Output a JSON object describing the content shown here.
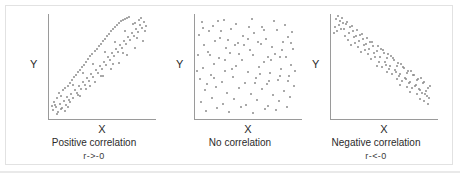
{
  "figure": {
    "title": "",
    "panel_count": 3,
    "colors": {
      "dot": "#8d8d8d",
      "axis": "#9a9a9a",
      "text": "#2b2b2b",
      "frame_border": "#e2e2e2",
      "background": "#ffffff"
    }
  },
  "panels": [
    {
      "id": "positive",
      "axis_y_label": "Y",
      "axis_x_label": "X",
      "caption": "Positive correlation",
      "caption_sub": "r->-0"
    },
    {
      "id": "none",
      "axis_y_label": "Y",
      "axis_x_label": "X",
      "caption": "No correlation",
      "caption_sub": ""
    },
    {
      "id": "negative",
      "axis_y_label": "Y",
      "axis_x_label": "X",
      "caption": "Negative correlation",
      "caption_sub": "r-<-0"
    }
  ],
  "chart_data": [
    {
      "type": "scatter",
      "title": "Positive correlation",
      "subtitle": "r->-0",
      "xlabel": "X",
      "ylabel": "Y",
      "xlim": [
        0,
        100
      ],
      "ylim": [
        0,
        100
      ],
      "grid": false,
      "legend": "none",
      "correlation_sign": "positive",
      "points": [
        [
          4,
          6
        ],
        [
          7,
          9
        ],
        [
          5,
          14
        ],
        [
          9,
          4
        ],
        [
          11,
          12
        ],
        [
          8,
          18
        ],
        [
          13,
          8
        ],
        [
          12,
          20
        ],
        [
          15,
          15
        ],
        [
          10,
          23
        ],
        [
          17,
          11
        ],
        [
          14,
          26
        ],
        [
          18,
          19
        ],
        [
          16,
          28
        ],
        [
          20,
          16
        ],
        [
          19,
          30
        ],
        [
          22,
          22
        ],
        [
          21,
          33
        ],
        [
          24,
          18
        ],
        [
          23,
          36
        ],
        [
          26,
          26
        ],
        [
          25,
          39
        ],
        [
          28,
          23
        ],
        [
          27,
          41
        ],
        [
          30,
          30
        ],
        [
          29,
          44
        ],
        [
          32,
          27
        ],
        [
          31,
          46
        ],
        [
          34,
          34
        ],
        [
          33,
          49
        ],
        [
          36,
          31
        ],
        [
          35,
          51
        ],
        [
          38,
          38
        ],
        [
          37,
          54
        ],
        [
          40,
          35
        ],
        [
          39,
          56
        ],
        [
          42,
          42
        ],
        [
          41,
          59
        ],
        [
          44,
          39
        ],
        [
          43,
          61
        ],
        [
          46,
          46
        ],
        [
          45,
          64
        ],
        [
          48,
          43
        ],
        [
          47,
          66
        ],
        [
          50,
          50
        ],
        [
          49,
          69
        ],
        [
          52,
          47
        ],
        [
          51,
          71
        ],
        [
          54,
          54
        ],
        [
          53,
          74
        ],
        [
          56,
          51
        ],
        [
          55,
          76
        ],
        [
          58,
          58
        ],
        [
          57,
          79
        ],
        [
          60,
          55
        ],
        [
          59,
          81
        ],
        [
          62,
          62
        ],
        [
          61,
          84
        ],
        [
          64,
          59
        ],
        [
          63,
          86
        ],
        [
          66,
          66
        ],
        [
          65,
          88
        ],
        [
          68,
          63
        ],
        [
          67,
          90
        ],
        [
          70,
          70
        ],
        [
          69,
          92
        ],
        [
          72,
          67
        ],
        [
          71,
          94
        ],
        [
          74,
          74
        ],
        [
          73,
          95
        ],
        [
          76,
          71
        ],
        [
          75,
          96
        ],
        [
          78,
          78
        ],
        [
          77,
          97
        ],
        [
          80,
          75
        ],
        [
          79,
          98
        ],
        [
          82,
          82
        ],
        [
          84,
          79
        ],
        [
          86,
          86
        ],
        [
          88,
          83
        ],
        [
          90,
          90
        ],
        [
          92,
          87
        ],
        [
          94,
          93
        ],
        [
          96,
          89
        ],
        [
          6,
          11
        ],
        [
          12,
          7
        ],
        [
          21,
          14
        ],
        [
          29,
          21
        ],
        [
          37,
          27
        ],
        [
          45,
          34
        ],
        [
          53,
          40
        ],
        [
          61,
          47
        ],
        [
          69,
          53
        ],
        [
          77,
          60
        ],
        [
          85,
          67
        ],
        [
          93,
          74
        ],
        [
          89,
          95
        ],
        [
          83,
          91
        ],
        [
          3,
          10
        ],
        [
          16,
          5
        ],
        [
          24,
          31
        ],
        [
          34,
          43
        ],
        [
          44,
          52
        ],
        [
          55,
          63
        ],
        [
          65,
          73
        ],
        [
          75,
          84
        ],
        [
          85,
          92
        ],
        [
          91,
          97
        ],
        [
          95,
          84
        ],
        [
          87,
          77
        ],
        [
          73,
          62
        ],
        [
          63,
          52
        ],
        [
          51,
          40
        ],
        [
          41,
          30
        ],
        [
          31,
          20
        ],
        [
          19,
          9
        ],
        [
          8,
          2
        ]
      ]
    },
    {
      "type": "scatter",
      "title": "No correlation",
      "subtitle": "",
      "xlabel": "X",
      "ylabel": "Y",
      "xlim": [
        0,
        100
      ],
      "ylim": [
        0,
        100
      ],
      "grid": false,
      "legend": "none",
      "correlation_sign": "none",
      "points": [
        [
          7,
          93
        ],
        [
          18,
          89
        ],
        [
          29,
          95
        ],
        [
          41,
          91
        ],
        [
          56,
          96
        ],
        [
          66,
          88
        ],
        [
          78,
          94
        ],
        [
          89,
          90
        ],
        [
          96,
          83
        ],
        [
          4,
          80
        ],
        [
          14,
          84
        ],
        [
          25,
          77
        ],
        [
          36,
          86
        ],
        [
          47,
          79
        ],
        [
          58,
          82
        ],
        [
          70,
          76
        ],
        [
          81,
          85
        ],
        [
          92,
          78
        ],
        [
          9,
          70
        ],
        [
          20,
          74
        ],
        [
          31,
          67
        ],
        [
          43,
          72
        ],
        [
          54,
          65
        ],
        [
          65,
          71
        ],
        [
          76,
          68
        ],
        [
          87,
          73
        ],
        [
          97,
          66
        ],
        [
          3,
          60
        ],
        [
          13,
          63
        ],
        [
          24,
          57
        ],
        [
          35,
          62
        ],
        [
          46,
          55
        ],
        [
          57,
          60
        ],
        [
          68,
          54
        ],
        [
          79,
          61
        ],
        [
          90,
          58
        ],
        [
          8,
          48
        ],
        [
          19,
          52
        ],
        [
          30,
          45
        ],
        [
          41,
          50
        ],
        [
          52,
          44
        ],
        [
          63,
          49
        ],
        [
          74,
          43
        ],
        [
          85,
          47
        ],
        [
          95,
          51
        ],
        [
          5,
          37
        ],
        [
          16,
          41
        ],
        [
          27,
          34
        ],
        [
          38,
          39
        ],
        [
          49,
          33
        ],
        [
          60,
          38
        ],
        [
          71,
          32
        ],
        [
          82,
          36
        ],
        [
          93,
          40
        ],
        [
          10,
          26
        ],
        [
          21,
          29
        ],
        [
          32,
          23
        ],
        [
          44,
          28
        ],
        [
          55,
          22
        ],
        [
          66,
          27
        ],
        [
          77,
          21
        ],
        [
          88,
          25
        ],
        [
          98,
          30
        ],
        [
          6,
          14
        ],
        [
          17,
          18
        ],
        [
          28,
          12
        ],
        [
          39,
          17
        ],
        [
          50,
          11
        ],
        [
          61,
          16
        ],
        [
          72,
          10
        ],
        [
          83,
          15
        ],
        [
          94,
          19
        ],
        [
          11,
          5
        ],
        [
          22,
          8
        ],
        [
          34,
          4
        ],
        [
          45,
          9
        ],
        [
          57,
          3
        ],
        [
          69,
          7
        ],
        [
          80,
          6
        ],
        [
          91,
          9
        ],
        [
          15,
          60
        ],
        [
          26,
          84
        ],
        [
          37,
          47
        ],
        [
          48,
          70
        ],
        [
          59,
          33
        ],
        [
          72,
          58
        ],
        [
          84,
          40
        ],
        [
          95,
          72
        ],
        [
          12,
          32
        ],
        [
          23,
          94
        ],
        [
          33,
          75
        ],
        [
          44,
          61
        ],
        [
          53,
          88
        ],
        [
          64,
          42
        ],
        [
          75,
          55
        ],
        [
          86,
          65
        ],
        [
          2,
          45
        ],
        [
          99,
          45
        ],
        [
          40,
          70
        ],
        [
          52,
          76
        ],
        [
          68,
          85
        ],
        [
          30,
          55
        ],
        [
          19,
          38
        ],
        [
          8,
          87
        ],
        [
          62,
          73
        ],
        [
          73,
          35
        ],
        [
          84,
          58
        ],
        [
          92,
          35
        ]
      ]
    },
    {
      "type": "scatter",
      "title": "Negative correlation",
      "subtitle": "r-<-0",
      "xlabel": "X",
      "ylabel": "Y",
      "xlim": [
        0,
        100
      ],
      "ylim": [
        0,
        100
      ],
      "grid": false,
      "legend": "none",
      "correlation_sign": "negative",
      "points": [
        [
          5,
          96
        ],
        [
          8,
          90
        ],
        [
          11,
          97
        ],
        [
          13,
          86
        ],
        [
          16,
          93
        ],
        [
          18,
          82
        ],
        [
          21,
          89
        ],
        [
          23,
          78
        ],
        [
          26,
          85
        ],
        [
          28,
          74
        ],
        [
          31,
          81
        ],
        [
          33,
          70
        ],
        [
          36,
          77
        ],
        [
          38,
          66
        ],
        [
          41,
          73
        ],
        [
          43,
          62
        ],
        [
          46,
          69
        ],
        [
          48,
          58
        ],
        [
          51,
          65
        ],
        [
          53,
          54
        ],
        [
          56,
          61
        ],
        [
          58,
          50
        ],
        [
          61,
          57
        ],
        [
          63,
          46
        ],
        [
          66,
          53
        ],
        [
          68,
          42
        ],
        [
          71,
          49
        ],
        [
          73,
          38
        ],
        [
          76,
          45
        ],
        [
          78,
          34
        ],
        [
          81,
          41
        ],
        [
          83,
          30
        ],
        [
          86,
          37
        ],
        [
          88,
          26
        ],
        [
          91,
          33
        ],
        [
          93,
          22
        ],
        [
          96,
          28
        ],
        [
          6,
          84
        ],
        [
          9,
          94
        ],
        [
          14,
          79
        ],
        [
          19,
          88
        ],
        [
          24,
          72
        ],
        [
          29,
          80
        ],
        [
          34,
          65
        ],
        [
          39,
          73
        ],
        [
          44,
          58
        ],
        [
          49,
          66
        ],
        [
          54,
          51
        ],
        [
          59,
          59
        ],
        [
          64,
          44
        ],
        [
          69,
          52
        ],
        [
          74,
          37
        ],
        [
          79,
          45
        ],
        [
          84,
          31
        ],
        [
          89,
          38
        ],
        [
          94,
          25
        ],
        [
          97,
          18
        ],
        [
          4,
          88
        ],
        [
          12,
          92
        ],
        [
          17,
          75
        ],
        [
          22,
          84
        ],
        [
          27,
          68
        ],
        [
          32,
          76
        ],
        [
          37,
          61
        ],
        [
          42,
          69
        ],
        [
          47,
          54
        ],
        [
          52,
          62
        ],
        [
          57,
          47
        ],
        [
          62,
          55
        ],
        [
          67,
          40
        ],
        [
          72,
          48
        ],
        [
          77,
          33
        ],
        [
          82,
          41
        ],
        [
          87,
          27
        ],
        [
          92,
          34
        ],
        [
          95,
          20
        ],
        [
          10,
          86
        ],
        [
          15,
          91
        ],
        [
          20,
          70
        ],
        [
          25,
          79
        ],
        [
          30,
          63
        ],
        [
          35,
          71
        ],
        [
          40,
          56
        ],
        [
          45,
          64
        ],
        [
          50,
          49
        ],
        [
          55,
          57
        ],
        [
          60,
          42
        ],
        [
          65,
          50
        ],
        [
          70,
          35
        ],
        [
          75,
          43
        ],
        [
          80,
          28
        ],
        [
          85,
          36
        ],
        [
          90,
          23
        ],
        [
          98,
          30
        ],
        [
          7,
          99
        ],
        [
          3,
          82
        ],
        [
          45,
          50
        ],
        [
          55,
          44
        ],
        [
          65,
          37
        ],
        [
          75,
          29
        ],
        [
          85,
          22
        ],
        [
          92,
          15
        ],
        [
          96,
          12
        ],
        [
          88,
          17
        ],
        [
          78,
          24
        ],
        [
          68,
          31
        ]
      ]
    }
  ]
}
